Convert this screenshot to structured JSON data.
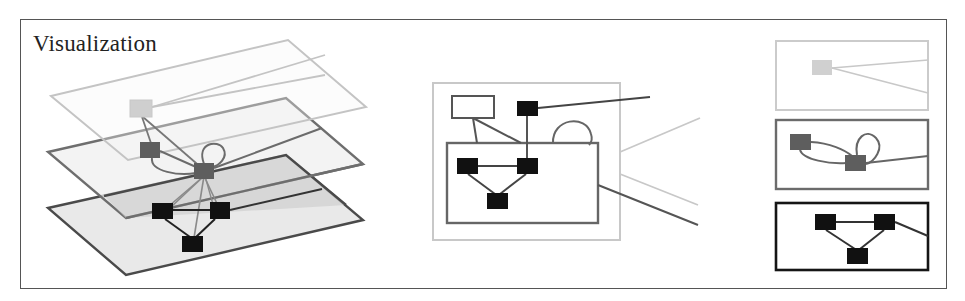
{
  "title": "Visualization",
  "colors": {
    "layer_light": "#c8c8c8",
    "layer_mid": "#6b6b6b",
    "layer_dark": "#1a1a1a",
    "plane_fill_light": "#f2f2f2",
    "plane_fill_mid": "#e6e6e6",
    "plane_fill_bottom": "#e9e9e9",
    "overlap_fill": "#d4d4d4",
    "frame": "#555555"
  },
  "panels": {
    "left": {
      "description": "3D stacked layer view",
      "planes": [
        {
          "name": "top-plane",
          "points": "51,96 288,40 366,107 128,160",
          "stroke": "#c4c4c4",
          "fill": "none"
        },
        {
          "name": "middle-plane",
          "points": "48,152 286,98 363,164 126,218",
          "stroke": "#6e6e6e",
          "fill": "#efefef"
        },
        {
          "name": "bottom-plane",
          "points": "48,208 286,155 363,220 126,275",
          "stroke": "#4a4a4a",
          "fill": "#e8e8e8"
        }
      ],
      "nodes": [
        {
          "name": "top-node",
          "x": 130,
          "y": 100,
          "w": 22,
          "h": 17,
          "fill": "#cfcfcf"
        },
        {
          "name": "mid-node-a",
          "x": 140,
          "y": 142,
          "w": 20,
          "h": 16,
          "fill": "#5e5e5e"
        },
        {
          "name": "mid-node-b",
          "x": 194,
          "y": 163,
          "w": 20,
          "h": 16,
          "fill": "#5e5e5e"
        },
        {
          "name": "bottom-node-a",
          "x": 152,
          "y": 203,
          "w": 21,
          "h": 16,
          "fill": "#111111"
        },
        {
          "name": "bottom-node-b",
          "x": 210,
          "y": 202,
          "w": 20,
          "h": 17,
          "fill": "#111111"
        },
        {
          "name": "bottom-node-c",
          "x": 182,
          "y": 236,
          "w": 21,
          "h": 16,
          "fill": "#111111"
        }
      ]
    },
    "center": {
      "description": "Nested 2D containment view",
      "outer_box": {
        "x": 433,
        "y": 83,
        "w": 187,
        "h": 157
      },
      "hollow_node": {
        "x": 452,
        "y": 96,
        "w": 42,
        "h": 22
      },
      "inner_box": {
        "x": 447,
        "y": 143,
        "w": 151,
        "h": 80
      },
      "nodes": [
        {
          "name": "center-top-node",
          "x": 517,
          "y": 101,
          "w": 21,
          "h": 15
        },
        {
          "name": "center-node-left",
          "x": 457,
          "y": 158,
          "w": 21,
          "h": 16
        },
        {
          "name": "center-node-right",
          "x": 517,
          "y": 158,
          "w": 21,
          "h": 16
        },
        {
          "name": "center-node-bottom",
          "x": 487,
          "y": 193,
          "w": 21,
          "h": 16
        }
      ]
    },
    "right": {
      "description": "Separated layer panels",
      "boxes": [
        {
          "name": "right-layer-top",
          "x": 776,
          "y": 41,
          "w": 152,
          "h": 69,
          "stroke": "#c8c8c8"
        },
        {
          "name": "right-layer-middle",
          "x": 776,
          "y": 120,
          "w": 152,
          "h": 69,
          "stroke": "#6b6b6b"
        },
        {
          "name": "right-layer-bottom",
          "x": 776,
          "y": 203,
          "w": 152,
          "h": 67,
          "stroke": "#151515"
        }
      ]
    }
  }
}
